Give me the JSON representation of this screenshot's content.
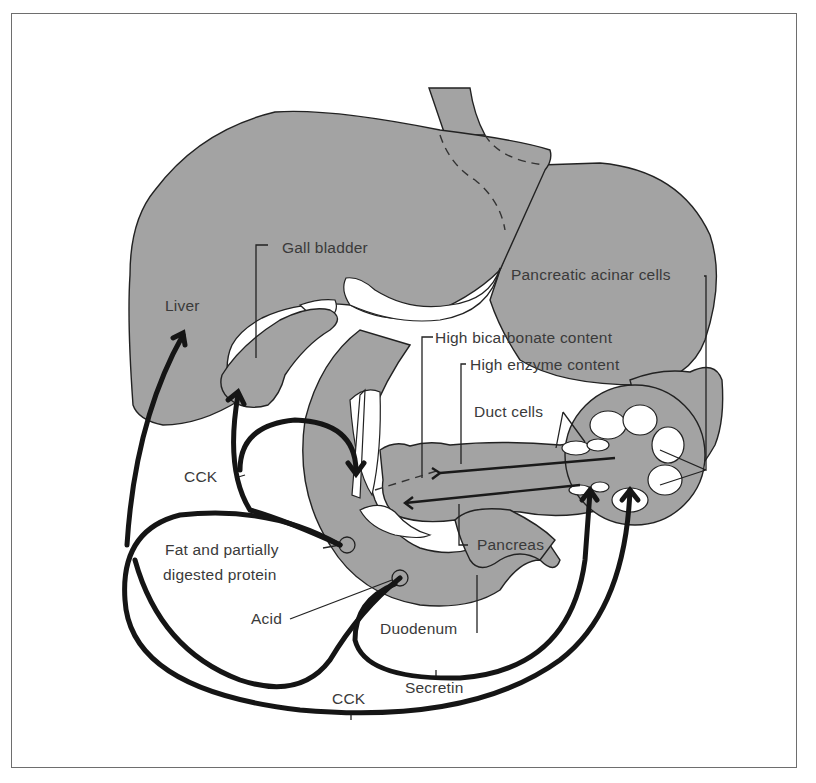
{
  "figure": {
    "topic": "Hormonal control of pancreatic and gall bladder secretion",
    "colors": {
      "organ_fill": "#a3a3a3",
      "outline": "#222222",
      "arrow": "#151515",
      "label_text": "#3a3a3a",
      "background": "#ffffff"
    }
  },
  "labels": {
    "liver": "Liver",
    "gall_bladder": "Gall bladder",
    "pancreatic_acinar_cells": "Pancreatic acinar cells",
    "high_bicarbonate": "High bicarbonate content",
    "high_enzyme": "High enzyme content",
    "duct_cells": "Duct cells",
    "cck_upper": "CCK",
    "fat_protein_line1": "Fat and partially",
    "fat_protein_line2": "digested protein",
    "acid": "Acid",
    "pancreas": "Pancreas",
    "duodenum": "Duodenum",
    "secretin": "Secretin",
    "cck_lower": "CCK"
  }
}
